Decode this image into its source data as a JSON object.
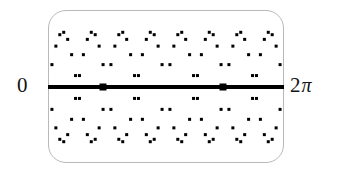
{
  "figure": {
    "kind": "graphing-calculator-screen"
  },
  "screen": {
    "border_color": "#b9b9bd",
    "background_color": "#ffffff",
    "corner_radius_px": 18,
    "left_px": 48,
    "top_px": 10,
    "width_px": 236,
    "height_px": 153
  },
  "axis": {
    "name": "horizontal-axis",
    "color": "#000000",
    "thickness_px": 4,
    "y_px": 87,
    "left_label": "0",
    "right_label_number": "2",
    "right_label_symbol": "π",
    "label_color": "#141414",
    "markers": [
      {
        "name": "axis-marker-left",
        "x_px": 103
      },
      {
        "name": "axis-marker-right",
        "x_px": 223
      }
    ]
  },
  "chart_data": {
    "type": "scatter",
    "title": "",
    "xlabel": "",
    "ylabel": "",
    "xlim": [
      0,
      6.2832
    ],
    "ylim": [
      -1,
      1
    ],
    "xtick_labels": [
      "0",
      "2π"
    ],
    "ytick_labels": [],
    "grid": false,
    "legend": null,
    "marker": "square-dot",
    "marker_color": "#000000",
    "marker_size_px": 3,
    "n_points_per_series": 60,
    "series": [
      {
        "name": "upper-envelope",
        "expression": "y = |sin(2x)|",
        "amplitude": 1,
        "cycles_across_interval": 4,
        "sign": "positive"
      },
      {
        "name": "lower-envelope",
        "expression": "y = -|sin(2x)|",
        "amplitude": 1,
        "cycles_across_interval": 4,
        "sign": "negative"
      }
    ],
    "annotations": [
      {
        "text": "0",
        "x": 0,
        "y": 0,
        "position": "left-outside"
      },
      {
        "text": "2π",
        "x": 6.2832,
        "y": 0,
        "position": "right-outside"
      }
    ]
  }
}
